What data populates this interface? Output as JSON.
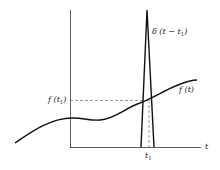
{
  "diagram": {
    "labels": {
      "delta": "δ (t − t",
      "delta_sub": "1",
      "delta_close": ")",
      "f_t1": "f (t",
      "f_t1_sub": "1",
      "f_t1_close": ")",
      "f_t": "f (t)",
      "t_axis": "t",
      "t1": "t",
      "t1_sub": "1"
    },
    "colors": {
      "line": "#111111",
      "axis": "#333333",
      "dashed": "#555555",
      "text": "#222222"
    }
  }
}
